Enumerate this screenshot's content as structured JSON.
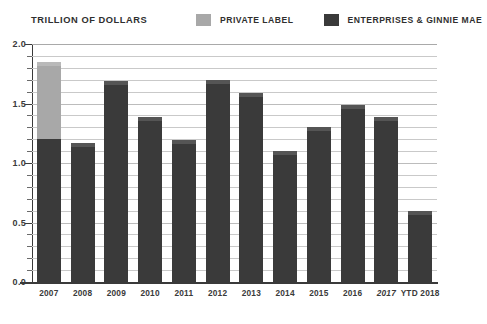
{
  "header": {
    "axis_title": "TRILLION OF DOLLARS"
  },
  "legend": {
    "items": [
      {
        "label": "PRIVATE LABEL",
        "color": "#a8a8a8",
        "key": "private_label"
      },
      {
        "label": "ENTERPRISES & GINNIE MAE",
        "color": "#3a3a3a",
        "key": "enterprises_ginnie_mae"
      }
    ]
  },
  "axes": {
    "y_ticks": [
      "2.0",
      "1.5",
      "1.0",
      "0.5",
      "0.0"
    ],
    "y_tick_values": [
      2.0,
      1.5,
      1.0,
      0.5,
      0.0
    ],
    "ylim": [
      0.0,
      2.0
    ],
    "minor_tick_step": 0.1,
    "grid": true,
    "grid_step": 0.1
  },
  "colors": {
    "dark": "#3a3a3a",
    "light": "#a8a8a8",
    "cap_dark": "#555555",
    "cap_light": "#b9b9b9",
    "grid": "#c9c9c9",
    "axis": "#3a3a3a",
    "text": "#2f2f2f",
    "background": "#ffffff"
  },
  "chart_data": {
    "type": "bar",
    "stacked": true,
    "title": "TRILLION OF DOLLARS",
    "xlabel": "",
    "ylabel": "TRILLION OF DOLLARS",
    "ylim": [
      0.0,
      2.0
    ],
    "grid": true,
    "legend_position": "top",
    "categories": [
      "2007",
      "2008",
      "2009",
      "2010",
      "2011",
      "2012",
      "2013",
      "2014",
      "2015",
      "2016",
      "2017",
      "YTD 2018"
    ],
    "category_styles": [
      "normal",
      "normal",
      "normal",
      "normal",
      "normal",
      "normal",
      "normal",
      "normal",
      "normal",
      "normal",
      "italic",
      "normal"
    ],
    "series": [
      {
        "name": "ENTERPRISES & GINNIE MAE",
        "color": "#3a3a3a",
        "values": [
          1.2,
          1.17,
          1.69,
          1.39,
          1.19,
          1.7,
          1.59,
          1.1,
          1.3,
          1.49,
          1.39,
          0.6
        ]
      },
      {
        "name": "PRIVATE LABEL",
        "color": "#a8a8a8",
        "values": [
          0.65,
          0.0,
          0.0,
          0.0,
          0.0,
          0.0,
          0.0,
          0.0,
          0.0,
          0.0,
          0.0,
          0.0
        ]
      }
    ],
    "totals": [
      1.85,
      1.17,
      1.69,
      1.39,
      1.19,
      1.7,
      1.59,
      1.1,
      1.3,
      1.49,
      1.39,
      0.6
    ]
  }
}
